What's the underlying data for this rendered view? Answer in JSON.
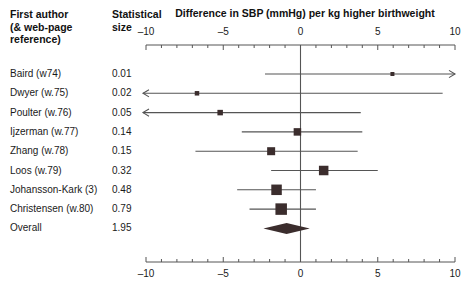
{
  "header": {
    "author_col": "First author (& web-page reference)",
    "author_col_line1": "First author",
    "author_col_line2": "(& web-page",
    "author_col_line3": "reference)",
    "size_col_line1": "Statistical",
    "size_col_line2": "size",
    "plot_title": "Difference in SBP (mmHg) per kg higher birthweight"
  },
  "axis": {
    "tick_labels": [
      "–10",
      "–5",
      "0",
      "5",
      "10"
    ],
    "tick_values": [
      -10,
      -5,
      0,
      5,
      10
    ],
    "min": -10,
    "max": 10,
    "minor_step": 1,
    "null_value": 0
  },
  "chart_data": {
    "type": "forest",
    "title": "Difference in SBP (mmHg) per kg higher birthweight",
    "xlabel": "Difference in SBP (mmHg) per kg higher birthweight",
    "ylabel": "",
    "xlim": [
      -10,
      10
    ],
    "grid": false,
    "legend": "none",
    "columns": [
      "First author (& web-page reference)",
      "Statistical size"
    ],
    "studies": [
      {
        "label": "Baird (w74)",
        "size": "0.01",
        "weight": 0.01,
        "estimate": 5.95,
        "ci_low": -2.3,
        "ci_high": 10.0,
        "arrow_left": false,
        "arrow_right": true,
        "marker": 4.0
      },
      {
        "label": "Dwyer (w.75)",
        "size": "0.02",
        "weight": 0.02,
        "estimate": -6.7,
        "ci_low": -10.0,
        "ci_high": 9.2,
        "arrow_left": true,
        "arrow_right": false,
        "marker": 4.5
      },
      {
        "label": "Poulter (w.76)",
        "size": "0.05",
        "weight": 0.05,
        "estimate": -5.2,
        "ci_low": -10.0,
        "ci_high": 3.9,
        "arrow_left": true,
        "arrow_right": false,
        "marker": 5.5
      },
      {
        "label": "Ijzerman (w.77)",
        "size": "0.14",
        "weight": 0.14,
        "estimate": -0.2,
        "ci_low": -3.8,
        "ci_high": 4.0,
        "arrow_left": false,
        "arrow_right": false,
        "marker": 7.5
      },
      {
        "label": "Zhang (w.78)",
        "size": "0.15",
        "weight": 0.15,
        "estimate": -1.9,
        "ci_low": -6.8,
        "ci_high": 3.7,
        "arrow_left": false,
        "arrow_right": false,
        "marker": 8.0
      },
      {
        "label": "Loos (w.79)",
        "size": "0.32",
        "weight": 0.32,
        "estimate": 1.5,
        "ci_low": -1.9,
        "ci_high": 5.0,
        "arrow_left": false,
        "arrow_right": false,
        "marker": 9.5
      },
      {
        "label": "Johansson-Kark (3)",
        "size": "0.48",
        "weight": 0.48,
        "estimate": -1.55,
        "ci_low": -4.1,
        "ci_high": 1.0,
        "arrow_left": false,
        "arrow_right": false,
        "marker": 10.5
      },
      {
        "label": "Christensen (w.80)",
        "size": "0.79",
        "weight": 0.79,
        "estimate": -1.25,
        "ci_low": -3.3,
        "ci_high": 1.0,
        "arrow_left": false,
        "arrow_right": false,
        "marker": 11.5
      }
    ],
    "overall": {
      "label": "Overall",
      "size": "1.95",
      "weight": 1.95,
      "estimate": -0.9,
      "ci_low": -2.4,
      "ci_high": 0.6,
      "shape": "diamond"
    }
  },
  "colors": {
    "marker": "#3b2d2d",
    "line": "#555555",
    "axis": "#555555",
    "text": "#1a1a1a",
    "background": "#ffffff"
  }
}
